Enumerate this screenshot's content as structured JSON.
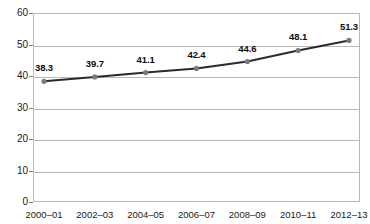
{
  "chart_data": {
    "type": "line",
    "title": "",
    "subtitle": "",
    "xlabel": "",
    "ylabel": "",
    "categories": [
      "2000–01",
      "2002–03",
      "2004–05",
      "2006–07",
      "2008–09",
      "2010–11",
      "2012–13"
    ],
    "values": [
      38.3,
      39.7,
      41.1,
      42.4,
      44.6,
      48.1,
      51.3
    ],
    "data_labels": [
      "38.3",
      "39.7",
      "41.1",
      "42.4",
      "44.6",
      "48.1",
      "51.3"
    ],
    "ylim": [
      0,
      60
    ],
    "y_ticks": [
      0,
      10,
      20,
      30,
      40,
      50,
      60
    ],
    "y_tick_labels": [
      "0",
      "10",
      "20",
      "30",
      "40",
      "50",
      "60"
    ],
    "grid": true,
    "grid_axis": "y",
    "legend": false,
    "legend_position": "none",
    "series": [
      {
        "name": "",
        "values": [
          38.3,
          39.7,
          41.1,
          42.4,
          44.6,
          48.1,
          51.3
        ],
        "line_color": "#2b2b2b",
        "marker_color": "#7b7b83",
        "marker_shape": "circle"
      }
    ],
    "colors": {
      "line": "#2b2b2b",
      "marker": "#7b7b83",
      "grid": "#b9b9b9",
      "axis": "#7d7d7d",
      "plot_background": "#ffffff",
      "text": "#1a1a1a",
      "data_label": "#0d0d0d"
    }
  }
}
